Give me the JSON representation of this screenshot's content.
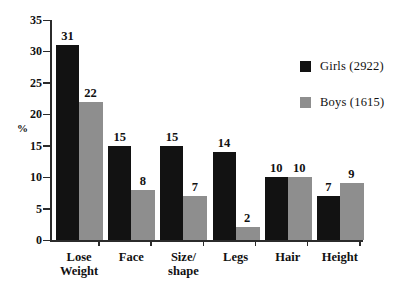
{
  "chart_data": {
    "type": "bar",
    "title": "",
    "xlabel": "",
    "ylabel": "%",
    "ylim": [
      0,
      35
    ],
    "yticks": [
      0,
      5,
      10,
      15,
      20,
      25,
      30,
      35
    ],
    "grid": false,
    "legend_position": "right",
    "categories": [
      "Lose Weight",
      "Face",
      "Size/ shape",
      "Legs",
      "Hair",
      "Height"
    ],
    "category_lines": [
      [
        "Lose",
        "Weight"
      ],
      [
        "Face",
        ""
      ],
      [
        "Size/",
        "shape"
      ],
      [
        "Legs",
        ""
      ],
      [
        "Hair",
        ""
      ],
      [
        "Height",
        ""
      ]
    ],
    "series": [
      {
        "name": "Girls (2922)",
        "short_name": "Girls",
        "count": "2922",
        "color": "#121212",
        "values": [
          31,
          15,
          15,
          14,
          10,
          7
        ],
        "labels": [
          "31",
          "15",
          "15",
          "14",
          "10",
          "7"
        ]
      },
      {
        "name": "Boys (1615)",
        "short_name": "Boys",
        "count": "1615",
        "color": "#8e8e8e",
        "values": [
          22,
          8,
          7,
          2,
          10,
          9
        ],
        "labels": [
          "22",
          "8",
          "7",
          "2",
          "10",
          "9"
        ]
      }
    ]
  },
  "axis": {
    "y_tick_labels": [
      "35",
      "30",
      "25",
      "20",
      "15",
      "10",
      "5",
      "0"
    ],
    "y_axis_title": "%"
  },
  "legend": {
    "items": [
      {
        "label": "Girls (2922)",
        "color": "#121212"
      },
      {
        "label": "Boys (1615)",
        "color": "#8e8e8e"
      }
    ]
  }
}
